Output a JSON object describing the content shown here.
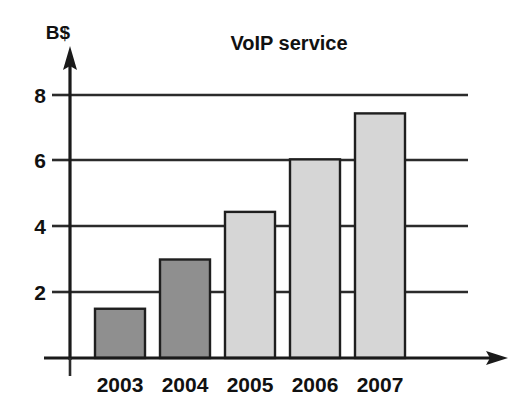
{
  "chart_data": {
    "type": "bar",
    "title": "VoIP service",
    "xlabel": "",
    "ylabel": "B$",
    "categories": [
      "2003",
      "2004",
      "2005",
      "2006",
      "2007"
    ],
    "values": [
      1.5,
      3.0,
      4.45,
      6.05,
      7.45
    ],
    "series": [
      {
        "name": "VoIP service revenue",
        "values": [
          1.5,
          3.0,
          4.45,
          6.05,
          7.45
        ]
      }
    ],
    "bar_colors": [
      "#8f8f8f",
      "#8f8f8f",
      "#d6d6d6",
      "#d6d6d6",
      "#d6d6d6"
    ],
    "ylim": [
      0,
      8.8
    ],
    "ytick_labels": [
      "8",
      "6",
      "4",
      "2"
    ],
    "ytick_values": [
      8,
      6,
      4,
      2
    ],
    "grid": true,
    "grid_axis": "y",
    "legend": "none",
    "axis_color": "#1a1a1a",
    "bar_edge_color": "#1f1f1f",
    "y_axis_arrow": true,
    "x_axis_arrow": true
  },
  "labels": {
    "title": "VoIP service",
    "y_unit": "B$",
    "y_ticks": [
      "8",
      "6",
      "4",
      "2"
    ],
    "x_ticks": [
      "2003",
      "2004",
      "2005",
      "2006",
      "2007"
    ]
  }
}
